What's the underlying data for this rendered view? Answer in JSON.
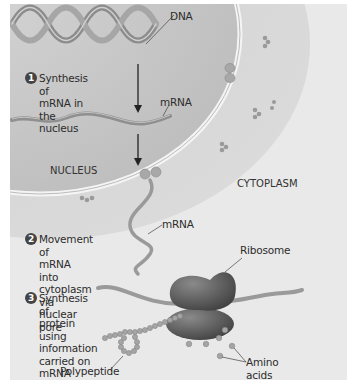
{
  "diagram": {
    "regions": {
      "nucleus": "NUCLEUS",
      "cytoplasm": "CYTOPLASM"
    },
    "labels": {
      "dna": "DNA",
      "mrna_nucleus": "mRNA",
      "mrna_cytoplasm": "mRNA",
      "ribosome": "Ribosome",
      "polypeptide": "Polypeptide",
      "amino_acids": "Amino\nacids"
    },
    "steps": [
      {
        "number": "1",
        "text": "Synthesis of\nmRNA in the\nnucleus"
      },
      {
        "number": "2",
        "text": "Movement of\nmRNA into cytoplasm\nvia nuclear pore"
      },
      {
        "number": "3",
        "text": "Synthesis of\nprotein using\ninformation\ncarried on\nmRNA"
      }
    ],
    "colors": {
      "background": "#e9e9e9",
      "nucleus_fill": "#c9c9c9",
      "cytoplasm_ring": "#d6d6d6",
      "strand": "#8f8f8f",
      "ribosome": "#5c5c5c",
      "text": "#2c2c2c"
    }
  }
}
